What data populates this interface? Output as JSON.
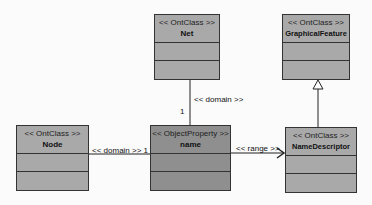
{
  "diagram": {
    "type": "UML class diagram",
    "classes": [
      {
        "id": "net",
        "stereotype": "<< OntClass >>",
        "name": "Net"
      },
      {
        "id": "graphical_feature",
        "stereotype": "<< OntClass >>",
        "name": "GraphicalFeature"
      },
      {
        "id": "node",
        "stereotype": "<< OntClass >>",
        "name": "Node"
      },
      {
        "id": "name_prop",
        "stereotype": "<< ObjectProperty >>",
        "name": "name"
      },
      {
        "id": "name_descriptor",
        "stereotype": "<< OntClass >>",
        "name": "NameDescriptor"
      }
    ],
    "connectors": [
      {
        "from": "name",
        "to": "Net",
        "label": "<< domain >>",
        "multiplicity": "1"
      },
      {
        "from": "name",
        "to": "Node",
        "label": "<< domain >>",
        "multiplicity": "1"
      },
      {
        "from": "name",
        "to": "NameDescriptor",
        "label": "<< range >>",
        "arrow": "open"
      },
      {
        "from": "NameDescriptor",
        "to": "GraphicalFeature",
        "kind": "generalization"
      }
    ],
    "labels": {
      "net_domain": "<< domain >>",
      "net_mult": "1",
      "node_domain": "<< domain >> 1",
      "range": "<< range >>"
    },
    "colors": {
      "box_fill": "#a9a9a9",
      "property_fill": "#8f8f8f",
      "border": "#333333",
      "background": "#fbfbfb"
    }
  }
}
